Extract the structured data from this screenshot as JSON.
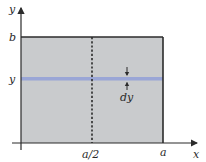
{
  "diagram": {
    "axes": {
      "x_label": "x",
      "y_label": "y"
    },
    "rectangle": {
      "fill": "#c9cbcd",
      "stroke": "#2b2b2b",
      "top_label": "b",
      "right_label": "a"
    },
    "midline": {
      "label": "a/2",
      "style": "dashed"
    },
    "strip": {
      "label_left": "y",
      "thickness_label": "dy",
      "color": "#9aa6d6"
    }
  }
}
